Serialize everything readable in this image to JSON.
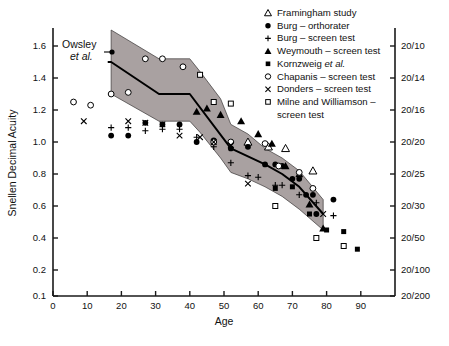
{
  "figure": {
    "title": "",
    "annotation": {
      "line1": "Owsley",
      "line2": "et al."
    }
  },
  "chart_data": {
    "type": "scatter",
    "title": "",
    "xlabel": "Age",
    "ylabel": "Snellen Decimal Acuity",
    "xlim": [
      0,
      100
    ],
    "ylim": [
      0.1,
      1.7
    ],
    "grid": false,
    "legend_position": "top-right",
    "x_ticks": [
      0,
      10,
      20,
      30,
      40,
      50,
      60,
      70,
      80,
      90
    ],
    "x_tick_labels": [
      "0",
      "10",
      "20",
      "30",
      "40",
      "50",
      "60",
      "70",
      "80",
      "90"
    ],
    "y_ticks": [
      1.6,
      1.4,
      1.2,
      1.0,
      0.8,
      0.6,
      0.4,
      0.2,
      0.1
    ],
    "y_tick_labels": [
      "1.6",
      "1.4",
      "1.2",
      "1.0",
      "0.8",
      "0.6",
      "0.4",
      "0.2",
      "0.1"
    ],
    "y2_label": "",
    "y2_ticks": [
      1.6,
      1.4,
      1.2,
      1.0,
      0.8,
      0.6,
      0.4,
      0.2,
      0.1
    ],
    "y2_tick_labels": [
      "20/10",
      "20/14",
      "20/16",
      "20/20",
      "20/25",
      "20/30",
      "20/50",
      "20/100",
      "20/200"
    ],
    "band": {
      "name": "Owsley et al. range",
      "color": "#a9a1a1",
      "upper": [
        [
          17,
          1.7
        ],
        [
          31,
          1.52
        ],
        [
          40,
          1.52
        ],
        [
          43,
          1.44
        ],
        [
          49,
          1.27
        ],
        [
          52,
          1.11
        ],
        [
          57,
          1.05
        ],
        [
          62,
          0.96
        ],
        [
          67,
          0.9
        ],
        [
          72,
          0.82
        ],
        [
          79,
          0.64
        ]
      ],
      "lower": [
        [
          17,
          1.3
        ],
        [
          31,
          1.13
        ],
        [
          40,
          1.13
        ],
        [
          43,
          1.06
        ],
        [
          49,
          0.9
        ],
        [
          52,
          0.81
        ],
        [
          57,
          0.77
        ],
        [
          62,
          0.72
        ],
        [
          67,
          0.66
        ],
        [
          72,
          0.58
        ],
        [
          79,
          0.45
        ]
      ]
    },
    "series": [
      {
        "name": "Owsley et al.",
        "marker": "line",
        "filled": true,
        "points": [
          [
            16,
            1.5
          ],
          [
            17,
            1.5
          ],
          [
            31,
            1.3
          ],
          [
            40,
            1.3
          ],
          [
            52,
            0.96
          ],
          [
            62,
            0.86
          ],
          [
            67,
            0.8
          ],
          [
            72,
            0.72
          ],
          [
            79,
            0.55
          ]
        ]
      },
      {
        "name": "Framingham study",
        "marker": "triangle-up",
        "filled": false,
        "points": [
          [
            57,
            1.0
          ],
          [
            63,
            0.97
          ],
          [
            68,
            0.96
          ],
          [
            76,
            0.82
          ]
        ]
      },
      {
        "name": "Burg – orthorater",
        "marker": "circle",
        "filled": true,
        "points": [
          [
            17,
            1.04
          ],
          [
            22,
            1.04
          ],
          [
            27,
            1.12
          ],
          [
            32,
            1.11
          ],
          [
            37,
            1.11
          ],
          [
            42,
            1.0
          ],
          [
            47,
            1.01
          ],
          [
            52,
            0.96
          ],
          [
            57,
            0.97
          ],
          [
            62,
            0.86
          ],
          [
            65,
            0.86
          ],
          [
            67,
            0.85
          ],
          [
            70,
            0.77
          ],
          [
            72,
            0.77
          ],
          [
            74,
            0.67
          ],
          [
            76,
            0.67
          ],
          [
            77,
            0.55
          ],
          [
            82,
            0.64
          ]
        ]
      },
      {
        "name": "Burg – screen test",
        "marker": "plus",
        "filled": false,
        "points": [
          [
            17,
            1.09
          ],
          [
            22,
            1.09
          ],
          [
            27,
            1.07
          ],
          [
            32,
            1.08
          ],
          [
            37,
            1.08
          ],
          [
            42,
            1.03
          ],
          [
            47,
            0.97
          ],
          [
            52,
            0.87
          ],
          [
            57,
            0.79
          ],
          [
            60,
            0.78
          ],
          [
            65,
            0.73
          ],
          [
            67,
            0.73
          ],
          [
            72,
            0.67
          ],
          [
            77,
            0.62
          ],
          [
            82,
            0.54
          ]
        ]
      },
      {
        "name": "Weymouth – screen test",
        "marker": "triangle-up",
        "filled": true,
        "points": [
          [
            42,
            1.19
          ],
          [
            45,
            1.21
          ],
          [
            49,
            1.17
          ],
          [
            55,
            1.13
          ],
          [
            60,
            1.05
          ],
          [
            64,
            0.99
          ],
          [
            68,
            0.85
          ],
          [
            72,
            0.8
          ],
          [
            75,
            0.61
          ],
          [
            79,
            0.46
          ]
        ]
      },
      {
        "name": "Kornzweig et al.",
        "marker": "square",
        "filled": true,
        "points": [
          [
            65,
            0.71
          ],
          [
            70,
            0.72
          ],
          [
            75,
            0.55
          ],
          [
            80,
            0.45
          ],
          [
            85,
            0.44
          ],
          [
            89,
            0.33
          ]
        ]
      },
      {
        "name": "Chapanis – screen test",
        "marker": "circle",
        "filled": false,
        "points": [
          [
            6,
            1.25
          ],
          [
            11,
            1.23
          ],
          [
            17,
            1.3
          ],
          [
            22,
            1.31
          ],
          [
            27,
            1.52
          ],
          [
            32,
            1.52
          ],
          [
            38,
            1.47
          ],
          [
            47,
            1.0
          ],
          [
            52,
            1.0
          ],
          [
            62,
            0.99
          ],
          [
            66,
            0.85
          ],
          [
            72,
            0.81
          ],
          [
            76,
            0.71
          ]
        ]
      },
      {
        "name": "Donders – screen test",
        "marker": "x",
        "filled": false,
        "points": [
          [
            9,
            1.13
          ],
          [
            22,
            1.13
          ],
          [
            27,
            1.12
          ],
          [
            32,
            1.11
          ],
          [
            37,
            1.04
          ],
          [
            43,
            1.03
          ],
          [
            47,
            1.0
          ],
          [
            52,
            0.98
          ],
          [
            57,
            0.74
          ],
          [
            79,
            0.55
          ]
        ]
      },
      {
        "name": "Milne and Williamson – screen test",
        "marker": "square",
        "filled": false,
        "points": [
          [
            43,
            1.42
          ],
          [
            47,
            1.25
          ],
          [
            52,
            1.24
          ],
          [
            65,
            0.6
          ],
          [
            77,
            0.4
          ],
          [
            85,
            0.35
          ]
        ]
      }
    ],
    "legend": [
      {
        "label": "Framingham study",
        "marker": "triangle-up",
        "filled": false
      },
      {
        "label": "Burg – orthorater",
        "marker": "circle",
        "filled": true
      },
      {
        "label": "Burg – screen test",
        "marker": "plus",
        "filled": false
      },
      {
        "label": "Weymouth – screen test",
        "marker": "triangle-up",
        "filled": true
      },
      {
        "label": "Kornzweig et al.",
        "marker": "square",
        "filled": true,
        "italic_tail": "et al."
      },
      {
        "label": "Chapanis – screen test",
        "marker": "circle",
        "filled": false
      },
      {
        "label": "Donders – screen test",
        "marker": "x",
        "filled": false
      },
      {
        "label": "Milne and Williamson –",
        "label2": "screen test",
        "marker": "square",
        "filled": false
      }
    ]
  }
}
